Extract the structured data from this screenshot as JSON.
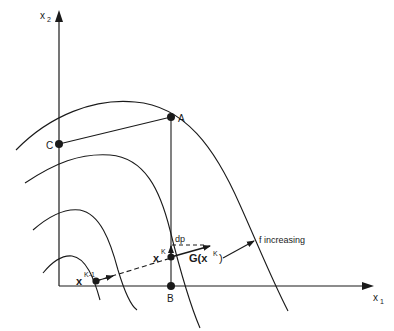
{
  "figure": {
    "axes": {
      "x_label": "x",
      "x_sub": "1",
      "y_label": "x",
      "y_sub": "2"
    },
    "points": {
      "A": "A",
      "B": "B",
      "C": "C",
      "xk_base": "x",
      "xk_sup": "K",
      "xk1_base": "x",
      "xk1_sup": "K-1"
    },
    "annotations": {
      "dp": "dp",
      "gradient": "G(x",
      "gradient_sup": "K",
      "gradient_close": ")",
      "f_increasing": "f increasing"
    },
    "colors": {
      "ink": "#1a1a1a",
      "background": "#ffffff"
    }
  }
}
